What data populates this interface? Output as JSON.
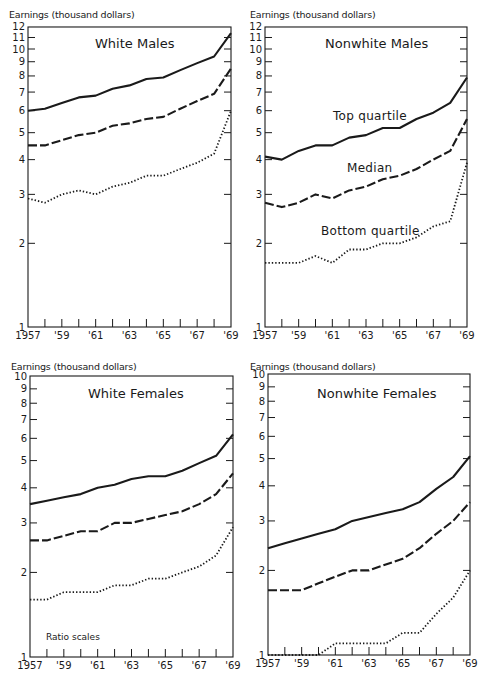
{
  "chart_data": [
    {
      "type": "line",
      "title": "White Males",
      "ylabel": "Earnings (thousand dollars)",
      "xlabel": "",
      "yscale": "log",
      "ylim": [
        1,
        12
      ],
      "yticks": [
        1,
        2,
        3,
        4,
        5,
        6,
        7,
        8,
        9,
        10,
        11,
        12
      ],
      "x": [
        1957,
        1958,
        1959,
        1960,
        1961,
        1962,
        1963,
        1964,
        1965,
        1966,
        1967,
        1968,
        1969
      ],
      "xtick_labels": [
        "1957",
        "'59",
        "'61",
        "'63",
        "'65",
        "'67",
        "'69"
      ],
      "series": [
        {
          "name": "Top quartile",
          "style": "solid",
          "values": [
            6.0,
            6.1,
            6.4,
            6.7,
            6.8,
            7.2,
            7.4,
            7.8,
            7.9,
            8.4,
            8.9,
            9.4,
            11.4
          ]
        },
        {
          "name": "Median",
          "style": "dashed",
          "values": [
            4.5,
            4.5,
            4.7,
            4.9,
            5.0,
            5.3,
            5.4,
            5.6,
            5.7,
            6.1,
            6.5,
            6.9,
            8.5
          ]
        },
        {
          "name": "Bottom quartile",
          "style": "dotted",
          "values": [
            2.9,
            2.8,
            3.0,
            3.1,
            3.0,
            3.2,
            3.3,
            3.5,
            3.5,
            3.7,
            3.9,
            4.2,
            6.0
          ]
        }
      ]
    },
    {
      "type": "line",
      "title": "Nonwhite Males",
      "ylabel": "Earnings (thousand dollars)",
      "xlabel": "",
      "yscale": "log",
      "ylim": [
        1,
        12
      ],
      "yticks": [
        1,
        2,
        3,
        4,
        5,
        6,
        7,
        8,
        9,
        10,
        11,
        12
      ],
      "x": [
        1957,
        1958,
        1959,
        1960,
        1961,
        1962,
        1963,
        1964,
        1965,
        1966,
        1967,
        1968,
        1969
      ],
      "xtick_labels": [
        "1957",
        "'59",
        "'61",
        "'63",
        "'65",
        "'67",
        "'69"
      ],
      "annotations": [
        "Top quartile",
        "Median",
        "Bottom quartile"
      ],
      "series": [
        {
          "name": "Top quartile",
          "style": "solid",
          "values": [
            4.1,
            4.0,
            4.3,
            4.5,
            4.5,
            4.8,
            4.9,
            5.2,
            5.2,
            5.6,
            5.9,
            6.4,
            7.9
          ]
        },
        {
          "name": "Median",
          "style": "dashed",
          "values": [
            2.8,
            2.7,
            2.8,
            3.0,
            2.9,
            3.1,
            3.2,
            3.4,
            3.5,
            3.7,
            4.0,
            4.3,
            5.6
          ]
        },
        {
          "name": "Bottom quartile",
          "style": "dotted",
          "values": [
            1.7,
            1.7,
            1.7,
            1.8,
            1.7,
            1.9,
            1.9,
            2.0,
            2.0,
            2.1,
            2.3,
            2.4,
            3.9
          ]
        }
      ]
    },
    {
      "type": "line",
      "title": "White Females",
      "ylabel": "Earnings (thousand dollars)",
      "xlabel": "",
      "yscale": "log",
      "ylim": [
        1,
        10
      ],
      "yticks": [
        1,
        2,
        3,
        4,
        5,
        6,
        7,
        8,
        9,
        10
      ],
      "x": [
        1957,
        1958,
        1959,
        1960,
        1961,
        1962,
        1963,
        1964,
        1965,
        1966,
        1967,
        1968,
        1969
      ],
      "xtick_labels": [
        "1957",
        "'59",
        "'61",
        "'63",
        "'65",
        "'67",
        "'69"
      ],
      "note": "Ratio scales",
      "series": [
        {
          "name": "Top quartile",
          "style": "solid",
          "values": [
            3.5,
            3.6,
            3.7,
            3.8,
            4.0,
            4.1,
            4.3,
            4.4,
            4.4,
            4.6,
            4.9,
            5.2,
            6.2
          ]
        },
        {
          "name": "Median",
          "style": "dashed",
          "values": [
            2.6,
            2.6,
            2.7,
            2.8,
            2.8,
            3.0,
            3.0,
            3.1,
            3.2,
            3.3,
            3.5,
            3.8,
            4.5
          ]
        },
        {
          "name": "Bottom quartile",
          "style": "dotted",
          "values": [
            1.6,
            1.6,
            1.7,
            1.7,
            1.7,
            1.8,
            1.8,
            1.9,
            1.9,
            2.0,
            2.1,
            2.3,
            2.9
          ]
        }
      ]
    },
    {
      "type": "line",
      "title": "Nonwhite Females",
      "ylabel": "Earnings (thousand dollars)",
      "xlabel": "",
      "yscale": "log",
      "ylim": [
        1,
        10
      ],
      "yticks": [
        1,
        2,
        3,
        4,
        5,
        6,
        7,
        8,
        9,
        10
      ],
      "x": [
        1957,
        1958,
        1959,
        1960,
        1961,
        1962,
        1963,
        1964,
        1965,
        1966,
        1967,
        1968,
        1969
      ],
      "xtick_labels": [
        "1957",
        "'59",
        "'61",
        "'63",
        "'65",
        "'67",
        "'69"
      ],
      "series": [
        {
          "name": "Top quartile",
          "style": "solid",
          "values": [
            2.4,
            2.5,
            2.6,
            2.7,
            2.8,
            3.0,
            3.1,
            3.2,
            3.3,
            3.5,
            3.9,
            4.3,
            5.1
          ]
        },
        {
          "name": "Median",
          "style": "dashed",
          "values": [
            1.7,
            1.7,
            1.7,
            1.8,
            1.9,
            2.0,
            2.0,
            2.1,
            2.2,
            2.4,
            2.7,
            3.0,
            3.5
          ]
        },
        {
          "name": "Bottom quartile",
          "style": "dotted",
          "values": [
            1.0,
            1.0,
            1.0,
            1.0,
            1.1,
            1.1,
            1.1,
            1.1,
            1.2,
            1.2,
            1.4,
            1.6,
            2.0
          ]
        }
      ]
    }
  ],
  "panels": [
    {
      "title": "White Males",
      "ylabel": "Earnings (thousand dollars)"
    },
    {
      "title": "Nonwhite Males",
      "ylabel": "Earnings (thousand dollars)",
      "labels": {
        "top": "Top quartile",
        "median": "Median",
        "bottom": "Bottom quartile"
      }
    },
    {
      "title": "White Females",
      "ylabel": "Earnings (thousand dollars)",
      "note": "Ratio scales"
    },
    {
      "title": "Nonwhite Females",
      "ylabel": "Earnings (thousand dollars)"
    }
  ],
  "colors": {
    "ink": "#1a1a1a",
    "background": "#ffffff"
  }
}
